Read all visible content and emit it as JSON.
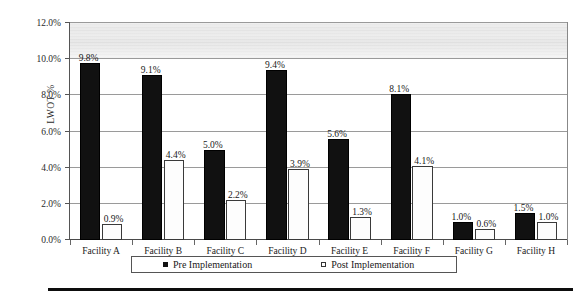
{
  "chart_data": {
    "type": "bar",
    "title": "",
    "xlabel": "",
    "ylabel": "LWOT %",
    "ylim": [
      0,
      12
    ],
    "grid": true,
    "legend_position": "bottom",
    "categories": [
      "Facility A",
      "Facility B",
      "Facility C",
      "Facility D",
      "Facility E",
      "Facility F",
      "Facility G",
      "Facility H"
    ],
    "ytick_labels": [
      "0.0%",
      "2.0%",
      "4.0%",
      "6.0%",
      "8.0%",
      "10.0%",
      "12.0%"
    ],
    "ytick_values": [
      0,
      2,
      4,
      6,
      8,
      10,
      12
    ],
    "series": [
      {
        "name": "Pre Implementation",
        "color": "#111111",
        "marker": "filled-square",
        "values": [
          9.8,
          9.1,
          5.0,
          9.4,
          5.6,
          8.1,
          1.0,
          1.5
        ],
        "labels": [
          "9.8%",
          "9.1%",
          "5.0%",
          "9.4%",
          "5.6%",
          "8.1%",
          "1.0%",
          "1.5%"
        ]
      },
      {
        "name": "Post Implementation",
        "color": "#ffffff",
        "marker": "hollow-square",
        "values": [
          0.9,
          4.4,
          2.2,
          3.9,
          1.3,
          4.1,
          0.6,
          1.0
        ],
        "labels": [
          "0.9%",
          "4.4%",
          "2.2%",
          "3.9%",
          "1.3%",
          "4.1%",
          "0.6%",
          "1.0%"
        ]
      }
    ]
  },
  "legend": {
    "entries": [
      {
        "label": "Pre Implementation"
      },
      {
        "label": "Post Implementation"
      }
    ]
  }
}
